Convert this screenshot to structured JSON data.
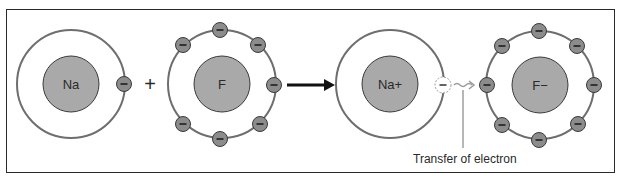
{
  "diagram": {
    "atoms": [
      {
        "id": "na",
        "label": "Na",
        "outer_electrons": 1
      },
      {
        "id": "f",
        "label": "F",
        "outer_electrons": 7
      },
      {
        "id": "na-ion",
        "label": "Na+",
        "outer_electrons": 0
      },
      {
        "id": "f-ion",
        "label": "F−",
        "outer_electrons": 8
      }
    ],
    "operators": {
      "plus": "+",
      "reaction_arrow": "→"
    },
    "electron_symbol": "−",
    "caption": "Transfer of electron",
    "colors": {
      "nucleus": "#a9a9a9",
      "electron": "#8c8c8c",
      "shell": "#6e6e6e",
      "outline": "#3a3a3a",
      "transfer_arrow": "#9a9a9a"
    }
  }
}
